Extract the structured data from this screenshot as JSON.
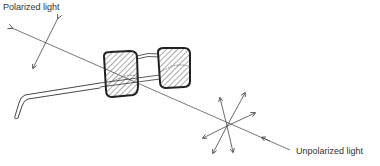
{
  "labels": {
    "polarized": "Polarized light",
    "unpolarized": "Unpolarized light"
  },
  "colors": {
    "line": "#444444",
    "frame": "#222222",
    "hatch": "#555555",
    "background": "#ffffff"
  },
  "elements": {
    "glasses": "polarizing-sunglasses",
    "polarized_arrow": "double-headed-arrow",
    "unpolarized_star": "multi-direction-arrows"
  }
}
